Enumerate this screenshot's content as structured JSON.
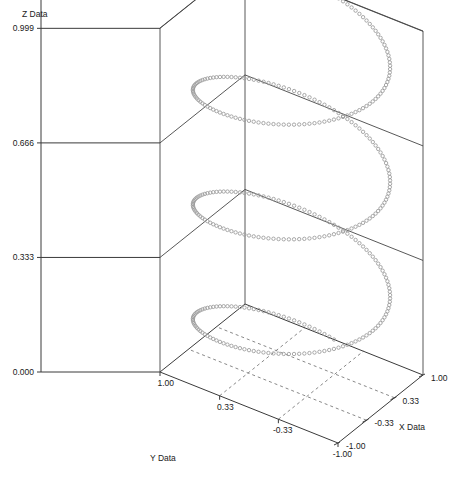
{
  "figure": {
    "background_color": "#ffffff",
    "width": 456,
    "height": 485
  },
  "axes": {
    "z": {
      "title": "Z Data",
      "ticks": [
        "0.999",
        "0.666",
        "0.333",
        "0.000"
      ],
      "tick_values": [
        0.999,
        0.666,
        0.333,
        0.0
      ],
      "range": [
        0.0,
        1.0
      ]
    },
    "y": {
      "title": "Y Data",
      "ticks": [
        "1.00",
        "0.33",
        "-0.33",
        "-1.00"
      ],
      "tick_values": [
        1.0,
        0.33,
        -0.33,
        -1.0
      ],
      "range": [
        -1.0,
        1.0
      ]
    },
    "x": {
      "title": "X Data",
      "ticks": [
        "1.00",
        "0.33",
        "-0.33",
        "-1.00"
      ],
      "tick_values": [
        1.0,
        0.33,
        -0.33,
        -1.0
      ],
      "range": [
        -1.0,
        1.0
      ]
    }
  },
  "chart_data": {
    "type": "scatter",
    "title": "",
    "xlabel": "X Data",
    "ylabel": "Y Data",
    "zlabel": "Z Data",
    "xlim": [
      -1.0,
      1.0
    ],
    "ylim": [
      -1.0,
      1.0
    ],
    "zlim": [
      0.0,
      1.0
    ],
    "grid": true,
    "legend": "none",
    "projection": "3d",
    "marker": "open-circle",
    "marker_color": "#9a9a9a",
    "marker_size": 3,
    "series": [
      {
        "name": "helix",
        "description": "3D helix: x = cos(t), y = sin(t), z = t/(6*pi), t from 0 to 6*pi (3 full turns)",
        "turns": 3,
        "n_points": 360,
        "parametric": {
          "x": "cos(t)",
          "y": "sin(t)",
          "z": "t / (6*pi)",
          "t_start": 0,
          "t_end": 18.8495559215
        }
      }
    ]
  }
}
